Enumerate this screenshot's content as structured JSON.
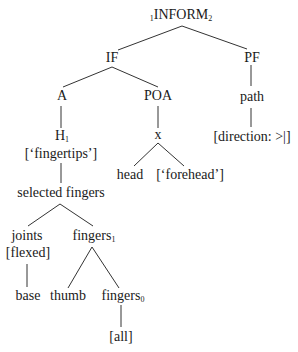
{
  "diagram": {
    "type": "feature-geometry-tree",
    "colors": {
      "text": "#1a1a1a",
      "edge": "#333333",
      "background": "#ffffff"
    },
    "nodes": {
      "root": {
        "prefix": "1",
        "label": "INFORM",
        "subscript": "2"
      },
      "if": {
        "label": "IF"
      },
      "pf": {
        "label": "PF"
      },
      "a": {
        "label": "A"
      },
      "poa": {
        "label": "POA"
      },
      "path": {
        "label": "path"
      },
      "direction": {
        "label": "[direction: >|]"
      },
      "h": {
        "label": "H",
        "subscript": "1"
      },
      "fingertips": {
        "label": "[‘fingertips’]"
      },
      "x": {
        "label": "x"
      },
      "head": {
        "label": "head"
      },
      "forehead": {
        "label": "[‘forehead’]"
      },
      "selected_fingers": {
        "label": "selected fingers"
      },
      "joints": {
        "label": "joints"
      },
      "flexed": {
        "label": "[flexed]"
      },
      "fingers1": {
        "label": "fingers",
        "subscript": "1"
      },
      "base": {
        "label": "base"
      },
      "thumb": {
        "label": "thumb"
      },
      "fingers0": {
        "label": "fingers",
        "subscript": "0"
      },
      "all": {
        "label": "[all]"
      }
    },
    "edges": [
      [
        "root",
        "if"
      ],
      [
        "root",
        "pf"
      ],
      [
        "if",
        "a"
      ],
      [
        "if",
        "poa"
      ],
      [
        "pf",
        "path"
      ],
      [
        "path",
        "direction"
      ],
      [
        "a",
        "h"
      ],
      [
        "h",
        "selected_fingers"
      ],
      [
        "poa",
        "x"
      ],
      [
        "x",
        "head"
      ],
      [
        "x",
        "forehead"
      ],
      [
        "selected_fingers",
        "joints"
      ],
      [
        "selected_fingers",
        "fingers1"
      ],
      [
        "joints",
        "base"
      ],
      [
        "fingers1",
        "thumb"
      ],
      [
        "fingers1",
        "fingers0"
      ],
      [
        "fingers0",
        "all"
      ]
    ]
  }
}
